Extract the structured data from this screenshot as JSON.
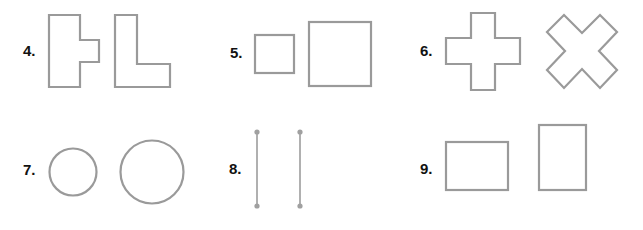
{
  "stroke_color": "#9a9a9a",
  "problems": [
    {
      "number": "4.",
      "shapes": [
        "t-shape",
        "l-shape"
      ]
    },
    {
      "number": "5.",
      "shapes": [
        "small-square",
        "large-square"
      ]
    },
    {
      "number": "6.",
      "shapes": [
        "plus-shape",
        "x-shape"
      ]
    },
    {
      "number": "7.",
      "shapes": [
        "small-circle",
        "large-circle"
      ]
    },
    {
      "number": "8.",
      "shapes": [
        "line-segment",
        "line-segment"
      ]
    },
    {
      "number": "9.",
      "shapes": [
        "landscape-rectangle",
        "portrait-rectangle"
      ]
    }
  ]
}
